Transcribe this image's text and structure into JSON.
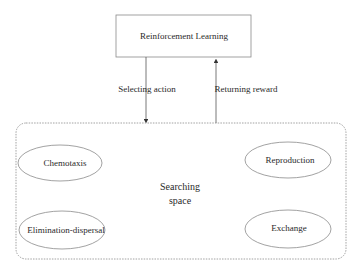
{
  "diagram": {
    "top_box": {
      "label": "Reinforcement Learning"
    },
    "arrows": {
      "down": {
        "label": "Selecting action"
      },
      "up": {
        "label": "Returning reward"
      }
    },
    "container": {
      "label_line1": "Searching",
      "label_line2": "space",
      "nodes": [
        {
          "label": "Chemotaxis"
        },
        {
          "label": "Reproduction"
        },
        {
          "label": "Elimination-dispersal"
        },
        {
          "label": "Exchange"
        }
      ]
    }
  },
  "colors": {
    "line": "#7a7a7a",
    "text": "#2a2a2a",
    "background": "#ffffff"
  }
}
